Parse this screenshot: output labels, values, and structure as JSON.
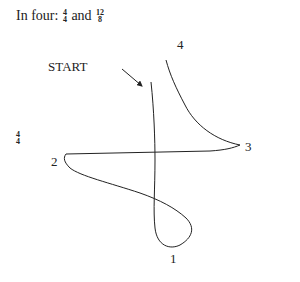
{
  "title": {
    "prefix": "In four:",
    "frac1": {
      "num": "4",
      "den": "4"
    },
    "conj": "and",
    "frac2": {
      "num": "12",
      "den": "8"
    }
  },
  "side_time_signature": {
    "num": "4",
    "den": "4"
  },
  "labels": {
    "start": "START",
    "beat1": "1",
    "beat2": "2",
    "beat3": "3",
    "beat4": "4"
  },
  "colors": {
    "ink": "#222222",
    "background": "#ffffff"
  }
}
